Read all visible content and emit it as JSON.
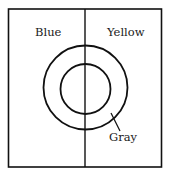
{
  "diagram": {
    "regions": [
      {
        "id": "left",
        "label": "Blue"
      },
      {
        "id": "right",
        "label": "Yellow"
      }
    ],
    "ring": {
      "label": "Gray"
    },
    "colors": {
      "line": "#111111",
      "text": "#1a1a1a",
      "background": "#ffffff"
    }
  }
}
